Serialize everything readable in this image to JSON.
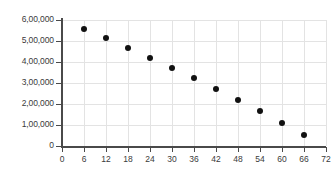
{
  "chart_data": {
    "type": "scatter",
    "title": "",
    "subtitle": "",
    "xlabel": "",
    "ylabel": "",
    "grid": true,
    "legend": false,
    "legend_position": "none",
    "xlim": [
      0,
      72
    ],
    "ylim": [
      0,
      600000
    ],
    "x_ticks": [
      0,
      6,
      12,
      18,
      24,
      30,
      36,
      42,
      48,
      54,
      60,
      66,
      72
    ],
    "x_tick_labels": [
      "0",
      "6",
      "12",
      "18",
      "24",
      "30",
      "36",
      "42",
      "48",
      "54",
      "60",
      "66",
      "72"
    ],
    "y_ticks": [
      0,
      100000,
      200000,
      300000,
      400000,
      500000,
      600000
    ],
    "y_tick_labels": [
      "0",
      "1,00,000",
      "2,00,000",
      "3,00,000",
      "4,00,000",
      "5,00,000",
      "6,00,000"
    ],
    "x": [
      6,
      12,
      18,
      24,
      30,
      36,
      42,
      48,
      54,
      60,
      66
    ],
    "values": [
      555000,
      513000,
      467000,
      420000,
      373000,
      323000,
      272000,
      220000,
      165000,
      110000,
      52000
    ],
    "points": [
      {
        "x": 6,
        "y": 555000
      },
      {
        "x": 12,
        "y": 513000
      },
      {
        "x": 18,
        "y": 467000
      },
      {
        "x": 24,
        "y": 420000
      },
      {
        "x": 30,
        "y": 373000
      },
      {
        "x": 36,
        "y": 323000
      },
      {
        "x": 42,
        "y": 272000
      },
      {
        "x": 48,
        "y": 220000
      },
      {
        "x": 54,
        "y": 165000
      },
      {
        "x": 60,
        "y": 110000
      },
      {
        "x": 66,
        "y": 52000
      }
    ],
    "marker_color": "#111111",
    "grid_color": "#e3e3e3",
    "axis_color": "#4a4a4a",
    "background_color": "#ffffff"
  }
}
